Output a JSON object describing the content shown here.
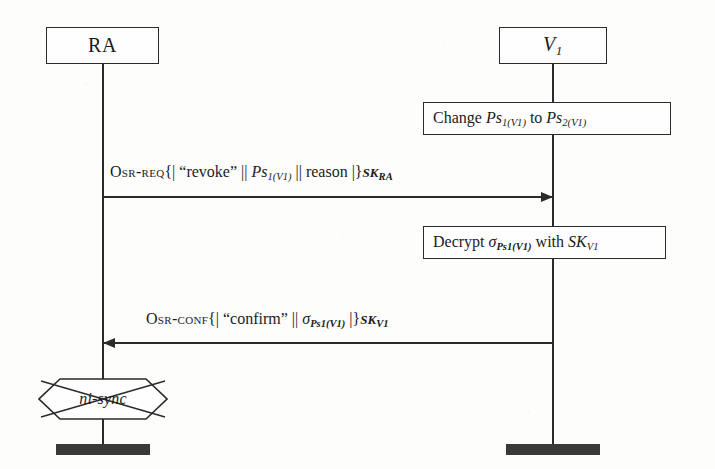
{
  "diagram": {
    "type": "sequence-diagram",
    "title_visible": false,
    "actors": [
      {
        "id": "ra",
        "label": "RA",
        "italic": false,
        "x": 103
      },
      {
        "id": "v1",
        "label": "V1",
        "label_base": "V",
        "label_sub": "1",
        "italic": true,
        "x": 553
      }
    ],
    "action_boxes": [
      {
        "id": "change-ps",
        "owner": "v1",
        "text": "Change Ps1(V1) to Ps2(V1)",
        "parts": {
          "verb": "Change",
          "operand1_base": "Ps",
          "operand1_sub": "1(V1)",
          "connector": "to",
          "operand2_base": "Ps",
          "operand2_sub": "2(V1)"
        }
      },
      {
        "id": "decrypt-sigma",
        "owner": "v1",
        "text": "Decrypt σPs1(V1) with SKV1",
        "parts": {
          "verb": "Decrypt",
          "sigma": "σ",
          "sigma_sub": "Ps1(V1)",
          "connector": "with",
          "key_base": "SK",
          "key_sub": "V1"
        }
      }
    ],
    "messages": [
      {
        "id": "osr-req",
        "from": "ra",
        "to": "v1",
        "direction": "right",
        "label": "Osr-req{| \"revoke\" || Ps1(V1) || reason |}SKRA",
        "parts": {
          "name": "Osr-req",
          "open": "{|",
          "field1": "“revoke”",
          "sep": "||",
          "field2_base": "Ps",
          "field2_sub": "1(V1)",
          "field3": "reason",
          "close": "|}",
          "key_base": "SK",
          "key_sub": "RA"
        }
      },
      {
        "id": "osr-conf",
        "from": "v1",
        "to": "ra",
        "direction": "left",
        "label": "Osr-conf{| \"confirm\" || σPs1(V1) |}SKV1",
        "parts": {
          "name": "Osr-conf",
          "open": "{|",
          "field1": "“confirm”",
          "sep": "||",
          "sigma": "σ",
          "sigma_sub": "Ps1(V1)",
          "close": "|}",
          "key_base": "SK",
          "key_sub": "V1"
        }
      }
    ],
    "state_markers": [
      {
        "id": "ni-sync",
        "owner": "ra",
        "shape": "hexagon-crossed",
        "label": "ni-sync",
        "struck_out": true
      }
    ],
    "terminators": [
      {
        "id": "ra-end",
        "owner": "ra"
      },
      {
        "id": "v1-end",
        "owner": "v1"
      }
    ],
    "colors": {
      "ink": "#2a2a2a",
      "paper": "#fdfdfc",
      "terminator_fill": "#3a3a3a"
    }
  }
}
